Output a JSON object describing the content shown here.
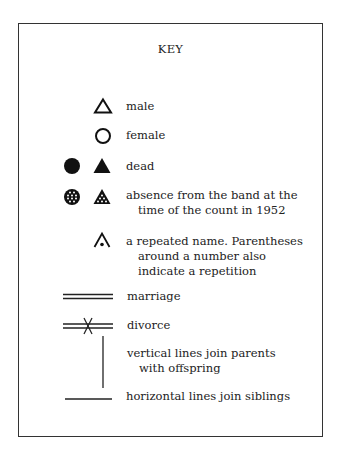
{
  "title": "KEY",
  "entries": [
    {
      "symbols": [
        "open-triangle"
      ],
      "label": "male"
    },
    {
      "symbols": [
        "open-circle"
      ],
      "label": "female"
    },
    {
      "symbols": [
        "filled-circle",
        "filled-triangle"
      ],
      "label": "dead"
    },
    {
      "symbols": [
        "dotted-circle",
        "dotted-triangle"
      ],
      "label_lines": [
        "absence from the band at the",
        "time of the count in 1952"
      ]
    },
    {
      "symbols": [
        "caret-with-dot"
      ],
      "label_lines": [
        "a repeated name. Parentheses",
        "around a number also",
        "indicate a repetition"
      ]
    },
    {
      "symbols": [
        "double-line"
      ],
      "label": "marriage"
    },
    {
      "symbols": [
        "double-line-crossed"
      ],
      "label": "divorce"
    },
    {
      "symbols": [
        "vertical-line"
      ],
      "label_lines": [
        "vertical lines join parents",
        "with offspring"
      ]
    },
    {
      "symbols": [
        "horizontal-line"
      ],
      "label": "horizontal lines join siblings"
    }
  ],
  "colors": {
    "ink": "#111111",
    "border": "#333333",
    "background": "#ffffff"
  }
}
